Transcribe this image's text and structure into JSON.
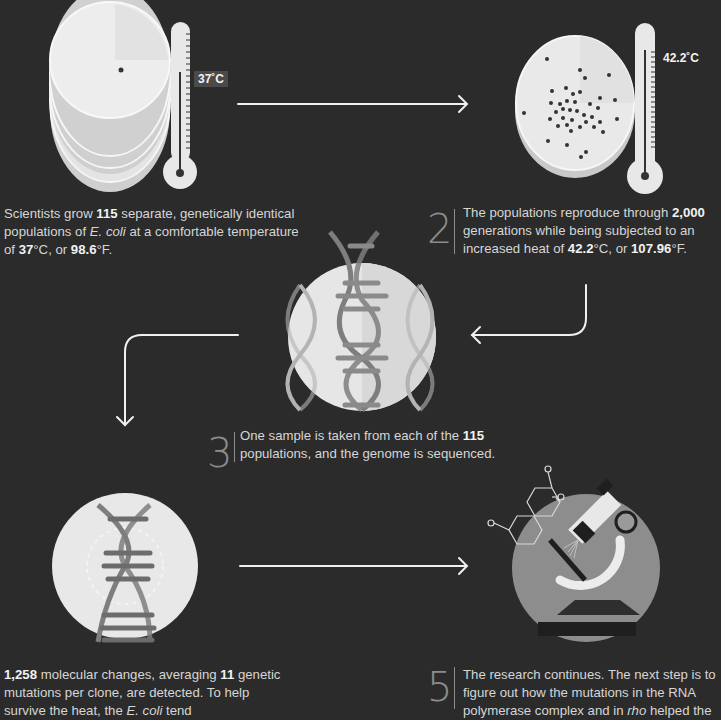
{
  "steps": [
    {
      "number": "1",
      "parts": [
        {
          "t": "Scientists grow "
        },
        {
          "t": "115",
          "b": true
        },
        {
          "t": " separate, genetically identical populations of "
        },
        {
          "t": "E. coli",
          "i": true
        },
        {
          "t": " at a comfortable temperature of "
        },
        {
          "t": "37",
          "b": true
        },
        {
          "t": "°C, or "
        },
        {
          "t": "98.6",
          "b": true
        },
        {
          "t": "°F."
        }
      ],
      "temp_label": "37˚C",
      "illustration": "stacked-petri-dishes-with-thermometer"
    },
    {
      "number": "2",
      "parts": [
        {
          "t": "The populations reproduce through "
        },
        {
          "t": "2,000",
          "b": true
        },
        {
          "t": " generations while being subjected to an increased heat of "
        },
        {
          "t": "42.2",
          "b": true
        },
        {
          "t": "°C, or "
        },
        {
          "t": "107.96",
          "b": true
        },
        {
          "t": "°F."
        }
      ],
      "temp_label": "42.2˚C",
      "illustration": "petri-dish-with-colonies-and-thermometer"
    },
    {
      "number": "3",
      "parts": [
        {
          "t": "One sample is taken from each of the "
        },
        {
          "t": "115",
          "b": true
        },
        {
          "t": " populations, and the genome is sequenced."
        }
      ],
      "illustration": "dna-helices-circle"
    },
    {
      "number": "4",
      "parts": [
        {
          "t": "1,258",
          "b": true
        },
        {
          "t": " molecular changes, averaging "
        },
        {
          "t": "11",
          "b": true
        },
        {
          "t": " genetic mutations per clone, are detected. To help survive the heat, the "
        },
        {
          "t": "E. coli",
          "i": true
        },
        {
          "t": " tend"
        }
      ],
      "illustration": "single-dna-helix-circle"
    },
    {
      "number": "5",
      "parts": [
        {
          "t": "The research continues. The next step is to figure out how the mutations in the RNA polymerase complex and in "
        },
        {
          "t": "rho",
          "i": true
        },
        {
          "t": " helped the"
        }
      ],
      "illustration": "microscope-with-molecule"
    }
  ],
  "colors": {
    "background": "#2b2b2b",
    "light": "#ececec",
    "mid": "#9a9a9a",
    "dark": "#555555",
    "text": "#d6d6d6"
  }
}
